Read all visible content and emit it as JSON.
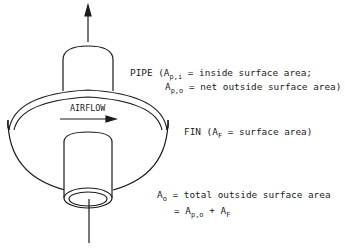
{
  "diagram": {
    "airflow_label": "AIRFLOW",
    "pipe": {
      "prefix": "PIPE (A",
      "sub_i": "p,i",
      "rest_i": " = inside surface area;",
      "a2": "A",
      "sub_o": "p,o",
      "rest_o": " = net outside surface area)"
    },
    "fin": {
      "prefix": "FIN (A",
      "sub": "F",
      "rest": " = surface area)"
    },
    "total": {
      "a": "A",
      "sub": "o",
      "rest": " = total outside surface area",
      "eq": "= A",
      "eq_sub1": "p,o",
      "plus": " + A",
      "eq_sub2": "F"
    },
    "colors": {
      "line": "#1a1a1a",
      "background": "#ffffff"
    }
  }
}
